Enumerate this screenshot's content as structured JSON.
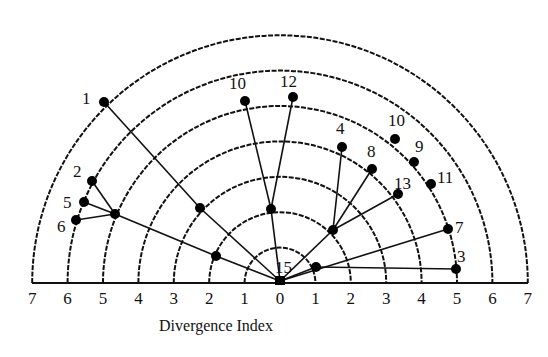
{
  "chart_data": {
    "type": "radial-tree",
    "title": "",
    "xlabel": "Divergence Index",
    "ylabel": "",
    "axis_ticks": [
      "7",
      "6",
      "5",
      "4",
      "3",
      "2",
      "1",
      "0",
      "1",
      "2",
      "3",
      "4",
      "5",
      "6",
      "7"
    ],
    "rings": [
      1,
      2,
      3,
      4,
      5,
      6,
      7
    ],
    "center": {
      "label": "15",
      "x": 280,
      "y": 281
    },
    "nodes": [
      {
        "id": "leaf-1",
        "label": "1",
        "x": 104,
        "y": 102,
        "lx": 82,
        "ly": 104
      },
      {
        "id": "leaf-10a",
        "label": "10",
        "x": 245,
        "y": 101,
        "lx": 229,
        "ly": 89
      },
      {
        "id": "leaf-12",
        "label": "12",
        "x": 293,
        "y": 97,
        "lx": 280,
        "ly": 87
      },
      {
        "id": "leaf-4",
        "label": "4",
        "x": 342,
        "y": 147,
        "lx": 336,
        "ly": 134
      },
      {
        "id": "leaf-8",
        "label": "8",
        "x": 372,
        "y": 169,
        "lx": 367,
        "ly": 157
      },
      {
        "id": "leaf-10b",
        "label": "10",
        "x": 395,
        "y": 139,
        "lx": 388,
        "ly": 126
      },
      {
        "id": "leaf-9",
        "label": "9",
        "x": 414,
        "y": 162,
        "lx": 415,
        "ly": 152
      },
      {
        "id": "leaf-11",
        "label": "11",
        "x": 431,
        "y": 184,
        "lx": 437,
        "ly": 183
      },
      {
        "id": "leaf-13",
        "label": "13",
        "x": 398,
        "y": 194,
        "lx": 394,
        "ly": 189
      },
      {
        "id": "leaf-7",
        "label": "7",
        "x": 448,
        "y": 229,
        "lx": 455,
        "ly": 233
      },
      {
        "id": "leaf-3",
        "label": "3",
        "x": 456,
        "y": 269,
        "lx": 457,
        "ly": 262
      },
      {
        "id": "leaf-2",
        "label": "2",
        "x": 92,
        "y": 181,
        "lx": 73,
        "ly": 177
      },
      {
        "id": "leaf-5",
        "label": "5",
        "x": 84,
        "y": 202,
        "lx": 63,
        "ly": 208
      },
      {
        "id": "leaf-6",
        "label": "6",
        "x": 76,
        "y": 220,
        "lx": 57,
        "ly": 232
      },
      {
        "id": "int-left",
        "label": "",
        "x": 115,
        "y": 214
      },
      {
        "id": "int-midleft",
        "label": "",
        "x": 200,
        "y": 208
      },
      {
        "id": "int-lowleft",
        "label": "",
        "x": 216,
        "y": 256
      },
      {
        "id": "int-top",
        "label": "",
        "x": 271,
        "y": 209
      },
      {
        "id": "int-right",
        "label": "",
        "x": 333,
        "y": 230
      },
      {
        "id": "int-low-right",
        "label": "",
        "x": 316,
        "y": 267
      }
    ],
    "edges": [
      [
        "leaf-1",
        "int-midleft"
      ],
      [
        "int-midleft",
        "center"
      ],
      [
        "leaf-10a",
        "int-top"
      ],
      [
        "leaf-12",
        "int-top"
      ],
      [
        "int-top",
        "center"
      ],
      [
        "leaf-2",
        "int-left"
      ],
      [
        "leaf-5",
        "int-left"
      ],
      [
        "leaf-6",
        "int-left"
      ],
      [
        "int-left",
        "int-lowleft"
      ],
      [
        "int-lowleft",
        "center"
      ],
      [
        "leaf-4",
        "int-right"
      ],
      [
        "leaf-8",
        "int-right"
      ],
      [
        "leaf-13",
        "int-right"
      ],
      [
        "int-right",
        "center"
      ],
      [
        "leaf-7",
        "center"
      ],
      [
        "leaf-3",
        "int-low-right"
      ],
      [
        "int-low-right",
        "center"
      ]
    ],
    "layout": {
      "center_x": 280,
      "baseline_y": 283,
      "unit_px": 35.4,
      "grid": "semicircular rings"
    }
  }
}
